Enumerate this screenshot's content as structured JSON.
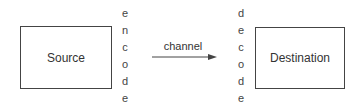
{
  "diagram": {
    "source": {
      "label": "Source"
    },
    "destination": {
      "label": "Destination"
    },
    "encode": {
      "letters": [
        "e",
        "n",
        "c",
        "o",
        "d",
        "e"
      ]
    },
    "decode": {
      "letters": [
        "d",
        "e",
        "c",
        "o",
        "d",
        "e"
      ]
    },
    "channel": {
      "label": "channel"
    }
  },
  "colors": {
    "stroke": "#444444",
    "text": "#333333",
    "background": "#ffffff"
  }
}
